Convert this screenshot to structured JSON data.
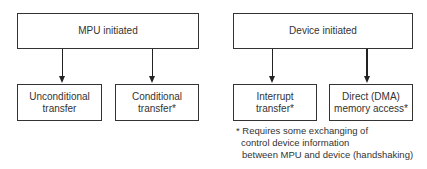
{
  "groups": [
    {
      "title": "MPU initiated",
      "children": [
        {
          "line1": "Unconditional",
          "line2": "transfer"
        },
        {
          "line1": "Conditional",
          "line2": "transfer*"
        }
      ]
    },
    {
      "title": "Device initiated",
      "children": [
        {
          "line1": "Interrupt",
          "line2": "transfer*"
        },
        {
          "line1": "Direct (DMA)",
          "line2": "memory access*"
        }
      ]
    }
  ],
  "footnote": {
    "line1": "* Requires some exchanging of",
    "line2": "control device information",
    "line3": "between MPU and device (handshaking)"
  }
}
